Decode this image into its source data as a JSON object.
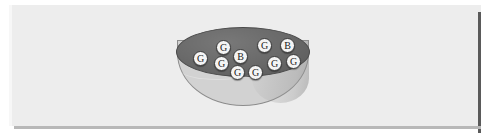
{
  "scene": {
    "title": "Bowl containing lettered balls",
    "background_color": "#ffffff",
    "panel_color": "#ededed",
    "shadow_color": "#5a5a5a"
  },
  "bowl": {
    "name": "bowl",
    "interior_color": "#6b6b6b",
    "body_color": "#d2d2d2",
    "outline_color": "#4a4a4a"
  },
  "balls": {
    "total_count": 12,
    "label_counts": {
      "G": 10,
      "B": 2
    },
    "ball_fill_color": "#f4f4f4",
    "ball_outline_color": "#3a3a3a",
    "items": [
      {
        "label": "G",
        "x": 40,
        "y": 13
      },
      {
        "label": "G",
        "x": 81,
        "y": 11
      },
      {
        "label": "B",
        "x": 104,
        "y": 11
      },
      {
        "label": "G",
        "x": 17,
        "y": 24
      },
      {
        "label": "B",
        "x": 57,
        "y": 22
      },
      {
        "label": "G",
        "x": 38,
        "y": 29
      },
      {
        "label": "G",
        "x": 91,
        "y": 29
      },
      {
        "label": "G",
        "x": 110,
        "y": 27
      },
      {
        "label": "G",
        "x": 54,
        "y": 38
      },
      {
        "label": "G",
        "x": 72,
        "y": 38
      }
    ]
  }
}
